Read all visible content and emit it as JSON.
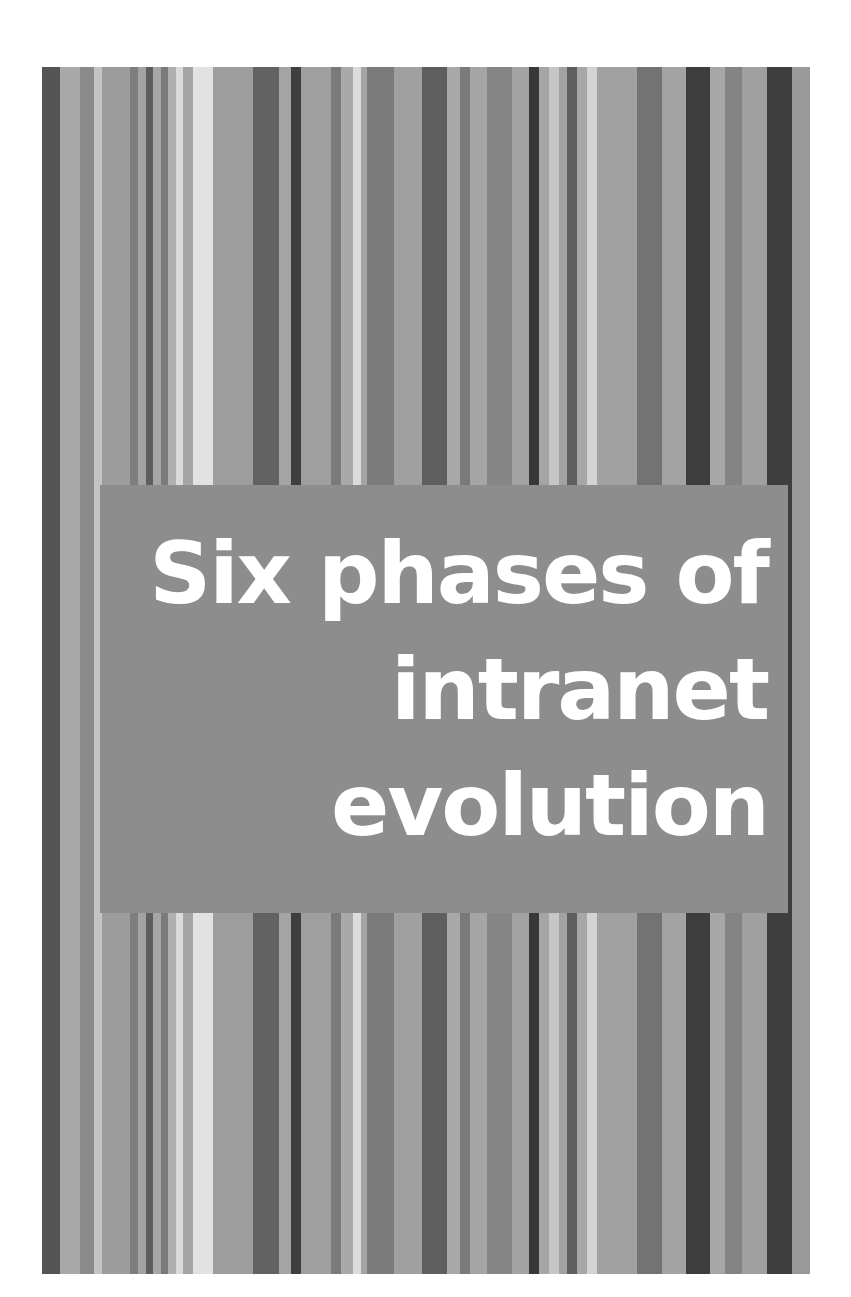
{
  "cover": {
    "title_lines": [
      "Six phases of",
      "intranet",
      "evolution"
    ],
    "colors": {
      "background": "#ffffff",
      "base_stripe": "#9a9a9a",
      "title_panel": "#8d8d8d",
      "title_text": "#ffffff"
    },
    "stripes": [
      {
        "x": 0,
        "w": 18,
        "c": "#555555"
      },
      {
        "x": 18,
        "w": 20,
        "c": "#a9a9a9"
      },
      {
        "x": 38,
        "w": 14,
        "c": "#8a8a8a"
      },
      {
        "x": 52,
        "w": 8,
        "c": "#c4c4c4"
      },
      {
        "x": 60,
        "w": 28,
        "c": "#9c9c9c"
      },
      {
        "x": 88,
        "w": 8,
        "c": "#7e7e7e"
      },
      {
        "x": 96,
        "w": 8,
        "c": "#a3a3a3"
      },
      {
        "x": 104,
        "w": 7,
        "c": "#5e5e5e"
      },
      {
        "x": 111,
        "w": 8,
        "c": "#a6a6a6"
      },
      {
        "x": 119,
        "w": 7,
        "c": "#7a7a7a"
      },
      {
        "x": 126,
        "w": 8,
        "c": "#b0b0b0"
      },
      {
        "x": 134,
        "w": 7,
        "c": "#dadada"
      },
      {
        "x": 141,
        "w": 10,
        "c": "#a5a5a5"
      },
      {
        "x": 151,
        "w": 20,
        "c": "#e2e2e2"
      },
      {
        "x": 171,
        "w": 40,
        "c": "#9d9d9d"
      },
      {
        "x": 211,
        "w": 26,
        "c": "#626262"
      },
      {
        "x": 237,
        "w": 12,
        "c": "#a4a4a4"
      },
      {
        "x": 249,
        "w": 10,
        "c": "#3f3f3f"
      },
      {
        "x": 259,
        "w": 30,
        "c": "#9f9f9f"
      },
      {
        "x": 289,
        "w": 10,
        "c": "#7a7a7a"
      },
      {
        "x": 299,
        "w": 12,
        "c": "#a9a9a9"
      },
      {
        "x": 311,
        "w": 8,
        "c": "#dcdcdc"
      },
      {
        "x": 319,
        "w": 6,
        "c": "#a4a4a4"
      },
      {
        "x": 325,
        "w": 27,
        "c": "#7b7b7b"
      },
      {
        "x": 352,
        "w": 28,
        "c": "#a0a0a0"
      },
      {
        "x": 380,
        "w": 25,
        "c": "#5e5e5e"
      },
      {
        "x": 405,
        "w": 13,
        "c": "#a8a8a8"
      },
      {
        "x": 418,
        "w": 10,
        "c": "#7a7a7a"
      },
      {
        "x": 428,
        "w": 17,
        "c": "#a5a5a5"
      },
      {
        "x": 445,
        "w": 25,
        "c": "#868686"
      },
      {
        "x": 470,
        "w": 17,
        "c": "#a3a3a3"
      },
      {
        "x": 487,
        "w": 10,
        "c": "#383838"
      },
      {
        "x": 497,
        "w": 10,
        "c": "#a5a5a5"
      },
      {
        "x": 507,
        "w": 10,
        "c": "#c6c6c6"
      },
      {
        "x": 517,
        "w": 8,
        "c": "#a2a2a2"
      },
      {
        "x": 525,
        "w": 10,
        "c": "#5e5e5e"
      },
      {
        "x": 535,
        "w": 10,
        "c": "#a7a7a7"
      },
      {
        "x": 545,
        "w": 10,
        "c": "#d3d3d3"
      },
      {
        "x": 555,
        "w": 40,
        "c": "#a1a1a1"
      },
      {
        "x": 595,
        "w": 25,
        "c": "#737373"
      },
      {
        "x": 620,
        "w": 24,
        "c": "#a3a3a3"
      },
      {
        "x": 644,
        "w": 24,
        "c": "#3d3d3d"
      },
      {
        "x": 668,
        "w": 15,
        "c": "#a7a7a7"
      },
      {
        "x": 683,
        "w": 17,
        "c": "#848484"
      },
      {
        "x": 700,
        "w": 25,
        "c": "#a0a0a0"
      },
      {
        "x": 725,
        "w": 25,
        "c": "#3e3e3e"
      },
      {
        "x": 750,
        "w": 18,
        "c": "#9a9a9a"
      }
    ]
  }
}
